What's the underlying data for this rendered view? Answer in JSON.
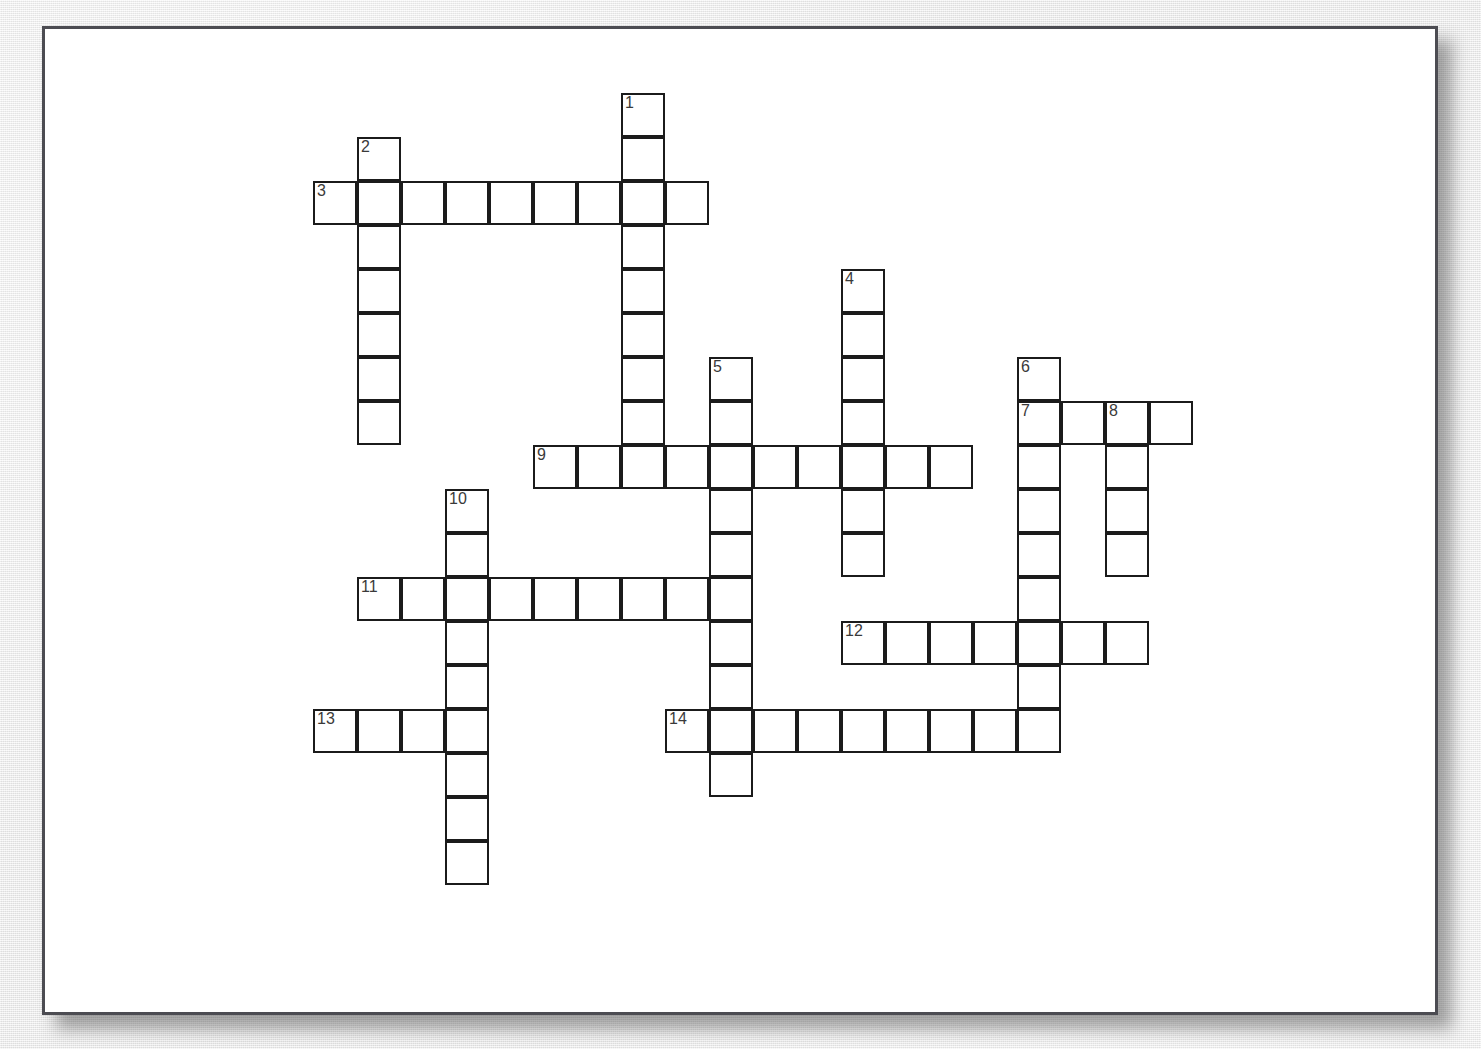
{
  "page": {
    "type": "crossword-puzzle-grid",
    "background_color": "#ededed",
    "paper_color": "#ffffff",
    "border_color": "#4c4c52",
    "cell_border_color": "#1b1b1b",
    "number_color": "#3a3a3a",
    "cell_size_px": 44,
    "grid_origin": {
      "x": 310,
      "y": 90
    }
  },
  "chart_data": {
    "type": "table",
    "title": "",
    "grid": {
      "cell_size": 44,
      "origin_x": 310,
      "origin_y": 90,
      "columns": 22,
      "rows": 19
    },
    "entries": [
      {
        "number": "1",
        "direction": "down",
        "col": 7,
        "row": 0,
        "length": 9
      },
      {
        "number": "2",
        "direction": "down",
        "col": 1,
        "row": 1,
        "length": 7
      },
      {
        "number": "3",
        "direction": "across",
        "col": 0,
        "row": 2,
        "length": 9
      },
      {
        "number": "4",
        "direction": "down",
        "col": 12,
        "row": 4,
        "length": 7
      },
      {
        "number": "5",
        "direction": "down",
        "col": 9,
        "row": 6,
        "length": 10
      },
      {
        "number": "6",
        "direction": "down",
        "col": 16,
        "row": 6,
        "length": 9
      },
      {
        "number": "7",
        "direction": "across",
        "col": 16,
        "row": 7,
        "length": 4
      },
      {
        "number": "8",
        "direction": "down",
        "col": 18,
        "row": 7,
        "length": 4
      },
      {
        "number": "9",
        "direction": "across",
        "col": 5,
        "row": 8,
        "length": 10
      },
      {
        "number": "10",
        "direction": "down",
        "col": 3,
        "row": 9,
        "length": 9
      },
      {
        "number": "11",
        "direction": "across",
        "col": 1,
        "row": 11,
        "length": 9
      },
      {
        "number": "12",
        "direction": "across",
        "col": 12,
        "row": 12,
        "length": 7
      },
      {
        "number": "13",
        "direction": "across",
        "col": 0,
        "row": 14,
        "length": 4
      },
      {
        "number": "14",
        "direction": "across",
        "col": 8,
        "row": 14,
        "length": 9
      }
    ],
    "numbered_labels": [
      "1",
      "2",
      "3",
      "4",
      "5",
      "6",
      "7",
      "8",
      "9",
      "10",
      "11",
      "12",
      "13",
      "14"
    ],
    "across_numbers": [
      "3",
      "7",
      "9",
      "11",
      "12",
      "13",
      "14"
    ],
    "down_numbers": [
      "1",
      "2",
      "4",
      "5",
      "6",
      "8",
      "10"
    ],
    "total_entries": 14,
    "letters": {}
  }
}
